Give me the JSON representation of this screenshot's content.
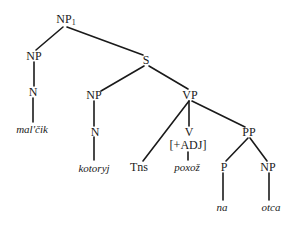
{
  "diagram": {
    "type": "syntax-tree",
    "nodes": {
      "np1": {
        "label": "NP",
        "subscript": "1"
      },
      "np_left": {
        "label": "NP"
      },
      "n_left": {
        "label": "N"
      },
      "word_malcik": {
        "label": "mal'čik"
      },
      "s": {
        "label": "S"
      },
      "np_rel": {
        "label": "NP"
      },
      "n_rel": {
        "label": "N"
      },
      "word_kotoryj": {
        "label": "kotoryj"
      },
      "vp": {
        "label": "VP"
      },
      "tns": {
        "label": "Tns"
      },
      "v": {
        "label": "V"
      },
      "v_feature": {
        "label": "[+ADJ]"
      },
      "word_poxoz": {
        "label": "poxož"
      },
      "pp": {
        "label": "PP"
      },
      "p": {
        "label": "P"
      },
      "word_na": {
        "label": "na"
      },
      "np_obj": {
        "label": "NP"
      },
      "word_otca": {
        "label": "otca"
      }
    },
    "edges": [
      [
        "np1",
        "np_left"
      ],
      [
        "np1",
        "s"
      ],
      [
        "np_left",
        "n_left"
      ],
      [
        "n_left",
        "word_malcik"
      ],
      [
        "s",
        "np_rel"
      ],
      [
        "s",
        "vp"
      ],
      [
        "np_rel",
        "n_rel"
      ],
      [
        "n_rel",
        "word_kotoryj"
      ],
      [
        "vp",
        "tns"
      ],
      [
        "vp",
        "v"
      ],
      [
        "vp",
        "pp"
      ],
      [
        "v_feature",
        "word_poxoz"
      ],
      [
        "pp",
        "p"
      ],
      [
        "pp",
        "np_obj"
      ],
      [
        "p",
        "word_na"
      ],
      [
        "np_obj",
        "word_otca"
      ]
    ]
  }
}
